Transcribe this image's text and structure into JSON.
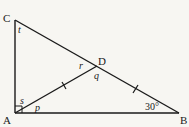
{
  "diagram": {
    "type": "geometry",
    "shape": "right triangle ABC with median AD",
    "line_color": "#1a1a1a",
    "vertices": {
      "A": {
        "label": "A",
        "x": 15,
        "y": 113
      },
      "B": {
        "label": "B",
        "x": 179,
        "y": 113
      },
      "C": {
        "label": "C",
        "x": 15,
        "y": 20
      },
      "D": {
        "label": "D",
        "x": 97,
        "y": 66
      }
    },
    "segments": [
      {
        "from": "A",
        "to": "B"
      },
      {
        "from": "A",
        "to": "C"
      },
      {
        "from": "C",
        "to": "B"
      },
      {
        "from": "A",
        "to": "D"
      }
    ],
    "tick_marks": [
      "AD",
      "DB"
    ],
    "right_angle_at": "A",
    "angle_labels": {
      "t": "t",
      "r": "r",
      "q": "q",
      "s": "s",
      "p": "p",
      "B": "30°"
    }
  }
}
